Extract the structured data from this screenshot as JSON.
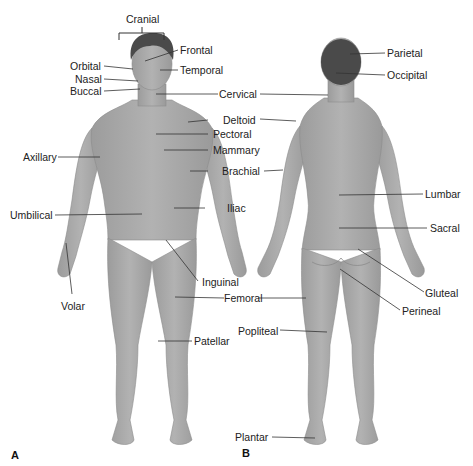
{
  "figure": {
    "panels": [
      {
        "id": "A",
        "label": "A",
        "view": "anterior"
      },
      {
        "id": "B",
        "label": "B",
        "view": "posterior"
      }
    ],
    "colors": {
      "skin": "#a9a9a9",
      "skin_shadow": "#8f8f8f",
      "hair": "#4a4a4a",
      "leader_line": "#333333",
      "text": "#222222",
      "background": "#ffffff"
    },
    "anterior_labels": {
      "cranial": "Cranial",
      "frontal": "Frontal",
      "orbital": "Orbital",
      "temporal": "Temporal",
      "nasal": "Nasal",
      "buccal": "Buccal",
      "cervical": "Cervical",
      "deltoid": "Deltoid",
      "pectoral": "Pectoral",
      "axillary": "Axillary",
      "mammary": "Mammary",
      "brachial": "Brachial",
      "umbilical": "Umbilical",
      "iliac": "Iliac",
      "inguinal": "Inguinal",
      "volar": "Volar",
      "femoral": "Femoral",
      "patellar": "Patellar"
    },
    "posterior_labels": {
      "parietal": "Parietal",
      "occipital": "Occipital",
      "lumbar": "Lumbar",
      "sacral": "Sacral",
      "gluteal": "Gluteal",
      "perineal": "Perineal",
      "popliteal": "Popliteal",
      "plantar": "Plantar"
    }
  }
}
